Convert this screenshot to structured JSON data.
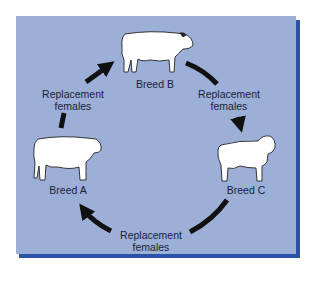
{
  "diagram": {
    "type": "rotational crossbreeding cycle",
    "background_color": "#9bafd7",
    "shadow_color": "#2a52a8",
    "arrow_color": "#111111",
    "nodes": [
      {
        "id": "breed_b",
        "label": "Breed B",
        "icon": "cow-icon"
      },
      {
        "id": "breed_c",
        "label": "Breed C",
        "icon": "brahman-bull-icon"
      },
      {
        "id": "breed_a",
        "label": "Breed A",
        "icon": "cow-icon"
      }
    ],
    "edges": [
      {
        "from": "Breed A",
        "to": "Breed B",
        "label_line1": "Replacement",
        "label_line2": "females"
      },
      {
        "from": "Breed B",
        "to": "Breed C",
        "label_line1": "Replacement",
        "label_line2": "females"
      },
      {
        "from": "Breed C",
        "to": "Breed A",
        "label_line1": "Replacement",
        "label_line2": "females"
      }
    ]
  }
}
